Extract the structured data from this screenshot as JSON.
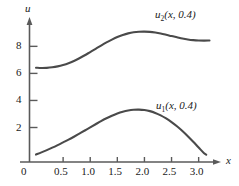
{
  "chart_data": {
    "type": "line",
    "title": "",
    "xlabel": "x",
    "ylabel": "u",
    "xlim": [
      -0.12,
      3.32
    ],
    "ylim": [
      -0.55,
      9.8
    ],
    "grid": false,
    "legend": "inline-annotations",
    "xticks": [
      "0",
      "0.5",
      "1.0",
      "1.5",
      "2.0",
      "2.5",
      "3.0"
    ],
    "xtick_values": [
      0,
      0.5,
      1.0,
      1.5,
      2.0,
      2.5,
      3.0
    ],
    "yticks": [
      "2",
      "4",
      "6",
      "8"
    ],
    "ytick_values": [
      2,
      4,
      6,
      8
    ],
    "series": [
      {
        "name": "u2(x, 0.4)",
        "label": "u",
        "subscript": "2",
        "label_args": "(x, 0.4)",
        "color": "#4a4a4a",
        "x": [
          0.0,
          0.1,
          0.2,
          0.3,
          0.4,
          0.5,
          0.6,
          0.7,
          0.8,
          0.9,
          1.0,
          1.1,
          1.2,
          1.3,
          1.4,
          1.5,
          1.6,
          1.7,
          1.8,
          1.9,
          2.0,
          2.1,
          2.2,
          2.3,
          2.4,
          2.5,
          2.6,
          2.7,
          2.8,
          2.9,
          3.0,
          3.1,
          3.2
        ],
        "y": [
          6.42,
          6.4,
          6.41,
          6.45,
          6.52,
          6.62,
          6.75,
          6.92,
          7.12,
          7.34,
          7.58,
          7.82,
          8.06,
          8.29,
          8.5,
          8.69,
          8.84,
          8.96,
          9.04,
          9.08,
          9.09,
          9.07,
          9.02,
          8.95,
          8.86,
          8.76,
          8.67,
          8.58,
          8.51,
          8.46,
          8.43,
          8.42,
          8.43
        ]
      },
      {
        "name": "u1(x, 0.4)",
        "label": "u",
        "subscript": "1",
        "label_args": "(x, 0.4)",
        "color": "#4a4a4a",
        "x": [
          0.0,
          0.1,
          0.2,
          0.3,
          0.4,
          0.5,
          0.6,
          0.7,
          0.8,
          0.9,
          1.0,
          1.1,
          1.2,
          1.3,
          1.4,
          1.5,
          1.6,
          1.7,
          1.8,
          1.9,
          2.0,
          2.1,
          2.2,
          2.3,
          2.4,
          2.5,
          2.6,
          2.7,
          2.8,
          2.9,
          3.0,
          3.1,
          3.14
        ],
        "y": [
          0.0,
          0.16,
          0.33,
          0.51,
          0.7,
          0.9,
          1.1,
          1.32,
          1.55,
          1.78,
          2.01,
          2.24,
          2.47,
          2.68,
          2.87,
          3.04,
          3.17,
          3.26,
          3.31,
          3.32,
          3.29,
          3.21,
          3.08,
          2.9,
          2.67,
          2.4,
          2.09,
          1.74,
          1.36,
          0.95,
          0.52,
          0.1,
          0.0
        ]
      }
    ],
    "annotations": [
      {
        "name": "upper-curve-label",
        "text": "u2(x, 0.4)",
        "x": 2.3,
        "y": 9.62
      },
      {
        "name": "lower-curve-label",
        "text": "u1(x, 0.4)",
        "x": 2.32,
        "y": 4.05
      }
    ],
    "axis_origin_label": "0"
  },
  "colors": {
    "curve": "#4a4a4a",
    "axis": "#5a5a5a",
    "text": "#1a1a1a",
    "background": "#ffffff"
  }
}
